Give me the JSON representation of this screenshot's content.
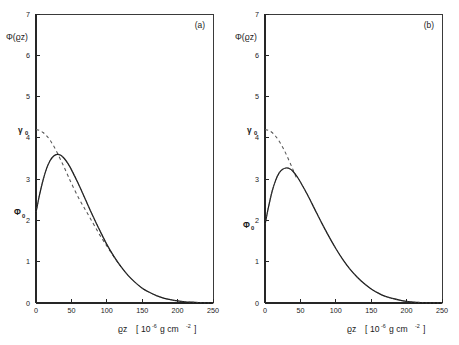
{
  "figure": {
    "background_color": "#ffffff",
    "ink_color": "#1a1a1a",
    "panel_count": 2
  },
  "panels": [
    {
      "tag": "(a)",
      "y_axis_title": "Φ(ϱz)",
      "x_axis_title": "ϱz",
      "x_axis_unit_open": "[",
      "x_axis_unit_base": "10",
      "x_axis_unit_exp": "-6",
      "x_axis_unit_rest": "g cm",
      "x_axis_unit_exp2": "-2",
      "x_axis_unit_close": "]",
      "markers": [
        {
          "name": "gamma-zero",
          "label": "γ",
          "sub": "0",
          "value": 4.2
        },
        {
          "name": "phi-zero",
          "label": "Φ",
          "sub": "0",
          "value": 2.2
        }
      ]
    },
    {
      "tag": "(b)",
      "y_axis_title": "Φ(ϱz)",
      "x_axis_title": "ϱz",
      "x_axis_unit_open": "[",
      "x_axis_unit_base": "10",
      "x_axis_unit_exp": "-6",
      "x_axis_unit_rest": "g cm",
      "x_axis_unit_exp2": "-2",
      "x_axis_unit_close": "]",
      "markers": [
        {
          "name": "gamma-zero",
          "label": "γ",
          "sub": "0",
          "value": 4.2
        },
        {
          "name": "phi-zero",
          "label": "Φ",
          "sub": "0",
          "value": 1.9
        }
      ]
    }
  ],
  "chart_data": [
    {
      "type": "line",
      "title": "(a)",
      "xlabel": "ϱz [10-6 g cm-2]",
      "ylabel": "Φ(ϱz)",
      "xlim": [
        0,
        250
      ],
      "ylim": [
        0,
        7
      ],
      "xticks": [
        0,
        50,
        100,
        150,
        200,
        250
      ],
      "yticks": [
        0,
        1,
        2,
        3,
        4,
        5,
        6,
        7
      ],
      "grid": false,
      "legend": "none",
      "annotations": [
        {
          "text": "γ0",
          "x": 0,
          "y": 4.2
        },
        {
          "text": "Φ0",
          "x": 0,
          "y": 2.2
        },
        {
          "text": "(a)",
          "x": 225,
          "y": 6.7
        }
      ],
      "series": [
        {
          "name": "measured-depth-distribution",
          "style": "solid",
          "x": [
            0,
            5,
            10,
            15,
            20,
            25,
            30,
            35,
            40,
            45,
            50,
            60,
            70,
            80,
            90,
            100,
            110,
            120,
            130,
            140,
            150,
            160,
            170,
            180,
            190,
            200,
            210,
            220,
            230,
            240,
            250
          ],
          "y": [
            2.2,
            2.62,
            2.98,
            3.26,
            3.45,
            3.56,
            3.6,
            3.58,
            3.5,
            3.38,
            3.23,
            2.88,
            2.5,
            2.12,
            1.76,
            1.42,
            1.13,
            0.88,
            0.67,
            0.5,
            0.36,
            0.26,
            0.18,
            0.12,
            0.08,
            0.05,
            0.03,
            0.02,
            0.01,
            0.0,
            0.0
          ]
        },
        {
          "name": "theoretical-gaussian-tail",
          "style": "dashed",
          "x": [
            0,
            5,
            10,
            15,
            20,
            25,
            30,
            35,
            40,
            45,
            50,
            60,
            70,
            80,
            90,
            100,
            110,
            120,
            130,
            140,
            150,
            160,
            170,
            180,
            190,
            200,
            210,
            220,
            230,
            240,
            250
          ],
          "y": [
            4.2,
            4.18,
            4.13,
            4.05,
            3.94,
            3.8,
            3.64,
            3.46,
            3.28,
            3.09,
            2.9,
            2.55,
            2.25,
            1.95,
            1.65,
            1.38,
            1.12,
            0.88,
            0.67,
            0.5,
            0.36,
            0.26,
            0.18,
            0.12,
            0.08,
            0.05,
            0.03,
            0.02,
            0.01,
            0.0,
            0.0
          ]
        }
      ]
    },
    {
      "type": "line",
      "title": "(b)",
      "xlabel": "ϱz [10-6 g cm-2]",
      "ylabel": "Φ(ϱz)",
      "xlim": [
        0,
        250
      ],
      "ylim": [
        0,
        7
      ],
      "xticks": [
        0,
        50,
        100,
        150,
        200,
        250
      ],
      "yticks": [
        0,
        1,
        2,
        3,
        4,
        5,
        6,
        7
      ],
      "grid": false,
      "legend": "none",
      "annotations": [
        {
          "text": "γ0",
          "x": 0,
          "y": 4.2
        },
        {
          "text": "Φ0",
          "x": 0,
          "y": 1.9
        },
        {
          "text": "(b)",
          "x": 225,
          "y": 6.7
        }
      ],
      "series": [
        {
          "name": "measured-depth-distribution",
          "style": "solid",
          "x": [
            0,
            5,
            10,
            15,
            20,
            25,
            30,
            35,
            40,
            45,
            50,
            60,
            70,
            80,
            90,
            100,
            110,
            120,
            130,
            140,
            150,
            160,
            170,
            180,
            190,
            200,
            210,
            220,
            230,
            240,
            250
          ],
          "y": [
            1.9,
            2.33,
            2.7,
            2.97,
            3.15,
            3.24,
            3.27,
            3.25,
            3.18,
            3.07,
            2.93,
            2.62,
            2.28,
            1.94,
            1.62,
            1.32,
            1.05,
            0.82,
            0.63,
            0.47,
            0.34,
            0.24,
            0.16,
            0.11,
            0.07,
            0.04,
            0.02,
            0.01,
            0.0,
            0.0,
            0.0
          ]
        },
        {
          "name": "theoretical-gaussian-tail",
          "style": "dashed",
          "x": [
            0,
            5,
            10,
            15,
            20,
            25,
            30,
            35,
            40,
            45,
            50,
            60,
            70,
            80,
            90,
            100,
            110,
            120,
            130,
            140,
            150,
            160,
            170,
            180,
            190,
            200,
            210,
            220,
            230,
            240,
            250
          ],
          "y": [
            4.2,
            4.18,
            4.13,
            4.04,
            3.92,
            3.77,
            3.6,
            3.41,
            3.21,
            3.0,
            2.8,
            2.42,
            2.1,
            1.82,
            1.55,
            1.3,
            1.05,
            0.82,
            0.63,
            0.47,
            0.34,
            0.24,
            0.16,
            0.11,
            0.07,
            0.04,
            0.02,
            0.01,
            0.0,
            0.0,
            0.0
          ]
        }
      ]
    }
  ]
}
